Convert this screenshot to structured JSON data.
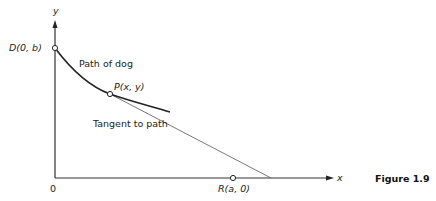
{
  "figure": {
    "caption": "Figure 1.9",
    "axes": {
      "y_label": "y",
      "x_label": "x",
      "origin_label": "0"
    },
    "points": {
      "D": {
        "label": "D(0, b)"
      },
      "P": {
        "label": "P(x, y)"
      },
      "R": {
        "label": "R(a, 0)"
      }
    },
    "annotations": {
      "curve": "Path of dog",
      "tangent": "Tangent to path"
    },
    "colors": {
      "line": "#222222",
      "tangent": "#444444",
      "background": "#ffffff"
    }
  }
}
